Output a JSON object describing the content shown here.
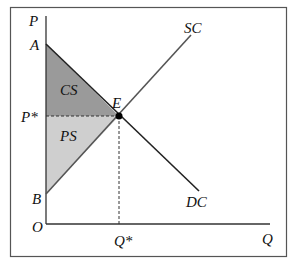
{
  "diagram": {
    "type": "supply-demand surplus diagram",
    "axes": {
      "y_label": "P",
      "x_label": "Q",
      "origin_label": "O"
    },
    "points": {
      "A": "A",
      "B": "B",
      "E": "E",
      "P_star": "P*",
      "Q_star": "Q*"
    },
    "curves": {
      "supply": "SC",
      "demand": "DC"
    },
    "regions": {
      "consumer_surplus": {
        "label": "CS",
        "color": "#9a9a9a"
      },
      "producer_surplus": {
        "label": "PS",
        "color": "#cfcfcf"
      }
    }
  }
}
